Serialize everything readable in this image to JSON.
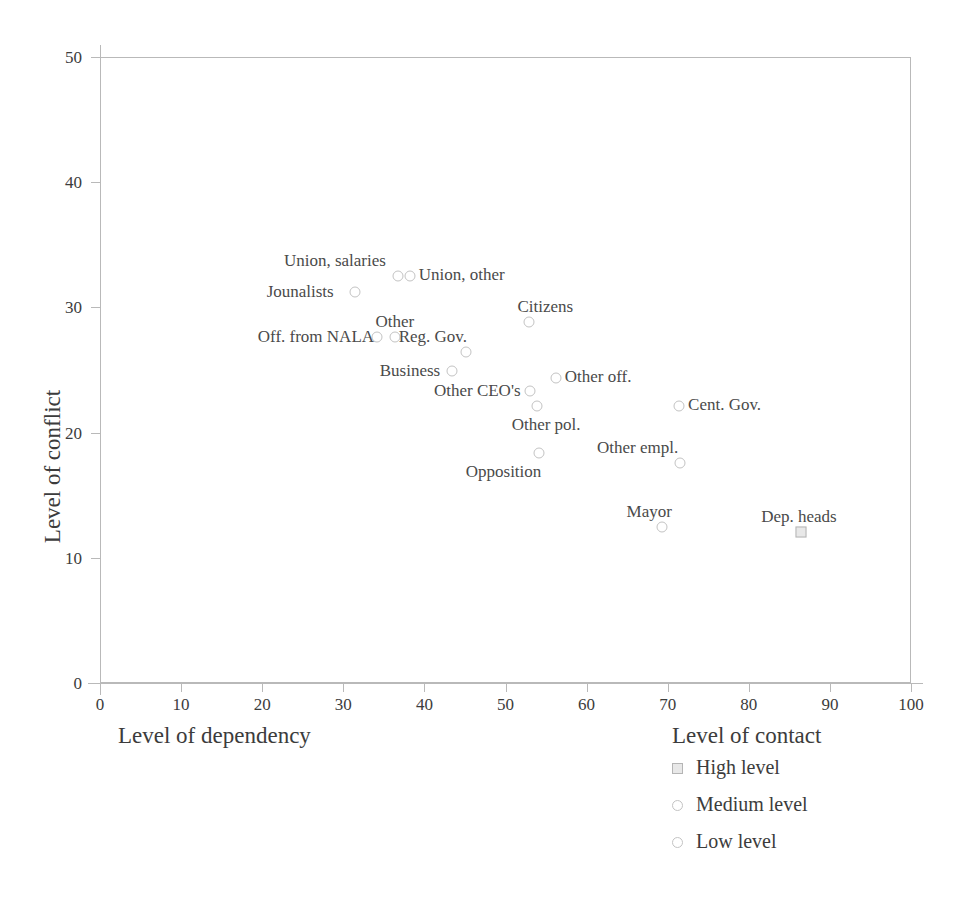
{
  "chart_data": {
    "type": "scatter",
    "title": "",
    "xlabel": "Level of dependency",
    "xlabel_secondary": "Level of contact",
    "ylabel": "Level of conflict",
    "xlim": [
      0,
      100
    ],
    "ylim": [
      0,
      50
    ],
    "xticks": [
      0,
      10,
      20,
      30,
      40,
      50,
      60,
      70,
      80,
      90,
      100
    ],
    "yticks": [
      0,
      10,
      20,
      30,
      40,
      50
    ],
    "grid": false,
    "legend_position": "below-right",
    "points": [
      {
        "label": "Union, salaries",
        "x": 36.8,
        "y": 32.5,
        "marker": "circle",
        "level": "Medium level",
        "label_pos": "above-left"
      },
      {
        "label": "Union, other",
        "x": 38.2,
        "y": 32.5,
        "marker": "circle",
        "level": "Medium level",
        "label_pos": "right"
      },
      {
        "label": "Jounalists",
        "x": 31.4,
        "y": 31.2,
        "marker": "circle",
        "level": "Medium level",
        "label_pos": "left"
      },
      {
        "label": "Off. from NALA",
        "x": 34.2,
        "y": 27.6,
        "marker": "circle",
        "level": "Medium level",
        "label_pos": "left"
      },
      {
        "label": "Other",
        "x": 36.4,
        "y": 27.6,
        "marker": "circle",
        "level": "Medium level",
        "label_pos": "above"
      },
      {
        "label": "Reg. Gov.",
        "x": 45.1,
        "y": 26.4,
        "marker": "circle",
        "level": "Medium level",
        "label_pos": "above-left"
      },
      {
        "label": "Citizens",
        "x": 52.9,
        "y": 28.8,
        "marker": "circle",
        "level": "Medium level",
        "label_pos": "above-right"
      },
      {
        "label": "Business",
        "x": 43.4,
        "y": 24.9,
        "marker": "circle",
        "level": "Medium level",
        "label_pos": "left"
      },
      {
        "label": "Other off.",
        "x": 56.2,
        "y": 24.4,
        "marker": "circle",
        "level": "Medium level",
        "label_pos": "right"
      },
      {
        "label": "Other CEO's",
        "x": 53.0,
        "y": 23.3,
        "marker": "circle",
        "level": "Medium level",
        "label_pos": "left"
      },
      {
        "label": "Other pol.",
        "x": 53.9,
        "y": 22.1,
        "marker": "circle",
        "level": "Medium level",
        "label_pos": "below-right"
      },
      {
        "label": "Cent. Gov.",
        "x": 71.4,
        "y": 22.1,
        "marker": "circle",
        "level": "Medium level",
        "label_pos": "right"
      },
      {
        "label": "Opposition",
        "x": 54.1,
        "y": 18.4,
        "marker": "circle",
        "level": "Medium level",
        "label_pos": "below-left"
      },
      {
        "label": "Other empl.",
        "x": 71.5,
        "y": 17.6,
        "marker": "circle",
        "level": "Medium level",
        "label_pos": "above-left"
      },
      {
        "label": "Mayor",
        "x": 69.3,
        "y": 12.5,
        "marker": "circle",
        "level": "Medium level",
        "label_pos": "above-left"
      },
      {
        "label": "Dep. heads",
        "x": 86.4,
        "y": 12.1,
        "marker": "square",
        "level": "High level",
        "label_pos": "above"
      }
    ],
    "legend": {
      "title": "Level of contact",
      "entries": [
        {
          "label": "High level",
          "marker": "square"
        },
        {
          "label": "Medium level",
          "marker": "circle"
        },
        {
          "label": "Low level",
          "marker": "circle"
        }
      ]
    }
  },
  "colors": {
    "axis": "#b9b9b9",
    "text": "#3c3c3c",
    "marker_stroke": "#c3c3c3",
    "marker_fill_high": "#e8e8e8",
    "background": "#ffffff"
  }
}
